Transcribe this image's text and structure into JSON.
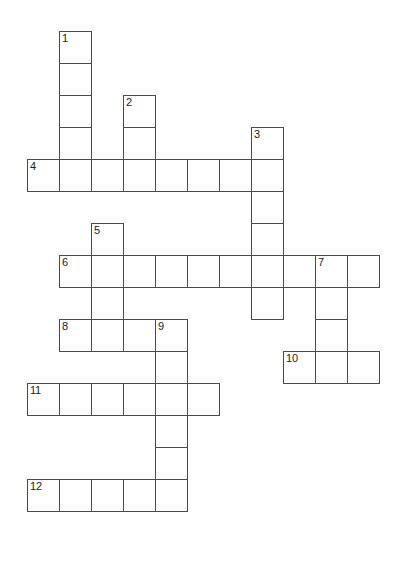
{
  "puzzle": {
    "title": "Crossword Grid",
    "type": "crossword",
    "grid": {
      "cell_size": 32,
      "origin_x": 27,
      "origin_y": 31,
      "cols": 12,
      "rows": 17,
      "line_color": "#4a4a4a",
      "cell_fill": "#ffffff",
      "background": "#ffffff",
      "number_color": "#1c1c1c"
    },
    "entries": [
      {
        "number": "1",
        "direction": "down",
        "col": 1,
        "row": 0,
        "length": 5
      },
      {
        "number": "2",
        "direction": "down",
        "col": 3,
        "row": 2,
        "length": 3
      },
      {
        "number": "3",
        "direction": "down",
        "col": 7,
        "row": 3,
        "length": 6
      },
      {
        "number": "4",
        "direction": "across",
        "col": 0,
        "row": 4,
        "length": 8
      },
      {
        "number": "5",
        "direction": "down",
        "col": 2,
        "row": 6,
        "length": 4
      },
      {
        "number": "6",
        "direction": "across",
        "col": 1,
        "row": 7,
        "length": 10
      },
      {
        "number": "7",
        "direction": "down",
        "col": 9,
        "row": 7,
        "length": 4
      },
      {
        "number": "8",
        "direction": "across",
        "col": 1,
        "row": 9,
        "length": 4
      },
      {
        "number": "9",
        "direction": "down",
        "col": 4,
        "row": 9,
        "length": 6
      },
      {
        "number": "10",
        "direction": "across",
        "col": 8,
        "row": 10,
        "length": 3
      },
      {
        "number": "11",
        "direction": "across",
        "col": 0,
        "row": 11,
        "length": 6
      },
      {
        "number": "12",
        "direction": "across",
        "col": 0,
        "row": 14,
        "length": 5
      }
    ],
    "cells": [
      {
        "col": 1,
        "row": 0,
        "number": "1"
      },
      {
        "col": 1,
        "row": 1,
        "number": ""
      },
      {
        "col": 1,
        "row": 2,
        "number": ""
      },
      {
        "col": 3,
        "row": 2,
        "number": "2"
      },
      {
        "col": 1,
        "row": 3,
        "number": ""
      },
      {
        "col": 3,
        "row": 3,
        "number": ""
      },
      {
        "col": 7,
        "row": 3,
        "number": "3"
      },
      {
        "col": 0,
        "row": 4,
        "number": "4"
      },
      {
        "col": 1,
        "row": 4,
        "number": ""
      },
      {
        "col": 2,
        "row": 4,
        "number": ""
      },
      {
        "col": 3,
        "row": 4,
        "number": ""
      },
      {
        "col": 4,
        "row": 4,
        "number": ""
      },
      {
        "col": 5,
        "row": 4,
        "number": ""
      },
      {
        "col": 6,
        "row": 4,
        "number": ""
      },
      {
        "col": 7,
        "row": 4,
        "number": ""
      },
      {
        "col": 7,
        "row": 5,
        "number": ""
      },
      {
        "col": 7,
        "row": 6,
        "number": ""
      },
      {
        "col": 2,
        "row": 6,
        "number": "5"
      },
      {
        "col": 1,
        "row": 7,
        "number": "6"
      },
      {
        "col": 2,
        "row": 7,
        "number": ""
      },
      {
        "col": 3,
        "row": 7,
        "number": ""
      },
      {
        "col": 4,
        "row": 7,
        "number": ""
      },
      {
        "col": 5,
        "row": 7,
        "number": ""
      },
      {
        "col": 6,
        "row": 7,
        "number": ""
      },
      {
        "col": 7,
        "row": 7,
        "number": ""
      },
      {
        "col": 8,
        "row": 7,
        "number": ""
      },
      {
        "col": 9,
        "row": 7,
        "number": "7"
      },
      {
        "col": 10,
        "row": 7,
        "number": ""
      },
      {
        "col": 2,
        "row": 8,
        "number": ""
      },
      {
        "col": 7,
        "row": 8,
        "number": ""
      },
      {
        "col": 9,
        "row": 8,
        "number": ""
      },
      {
        "col": 1,
        "row": 9,
        "number": "8"
      },
      {
        "col": 2,
        "row": 9,
        "number": ""
      },
      {
        "col": 3,
        "row": 9,
        "number": ""
      },
      {
        "col": 4,
        "row": 9,
        "number": "9"
      },
      {
        "col": 9,
        "row": 9,
        "number": ""
      },
      {
        "col": 4,
        "row": 10,
        "number": ""
      },
      {
        "col": 8,
        "row": 10,
        "number": "10"
      },
      {
        "col": 9,
        "row": 10,
        "number": ""
      },
      {
        "col": 10,
        "row": 10,
        "number": ""
      },
      {
        "col": 0,
        "row": 11,
        "number": "11"
      },
      {
        "col": 1,
        "row": 11,
        "number": ""
      },
      {
        "col": 2,
        "row": 11,
        "number": ""
      },
      {
        "col": 3,
        "row": 11,
        "number": ""
      },
      {
        "col": 4,
        "row": 11,
        "number": ""
      },
      {
        "col": 5,
        "row": 11,
        "number": ""
      },
      {
        "col": 4,
        "row": 12,
        "number": ""
      },
      {
        "col": 4,
        "row": 13,
        "number": ""
      },
      {
        "col": 0,
        "row": 14,
        "number": "12"
      },
      {
        "col": 1,
        "row": 14,
        "number": ""
      },
      {
        "col": 2,
        "row": 14,
        "number": ""
      },
      {
        "col": 3,
        "row": 14,
        "number": ""
      },
      {
        "col": 4,
        "row": 14,
        "number": ""
      }
    ]
  }
}
